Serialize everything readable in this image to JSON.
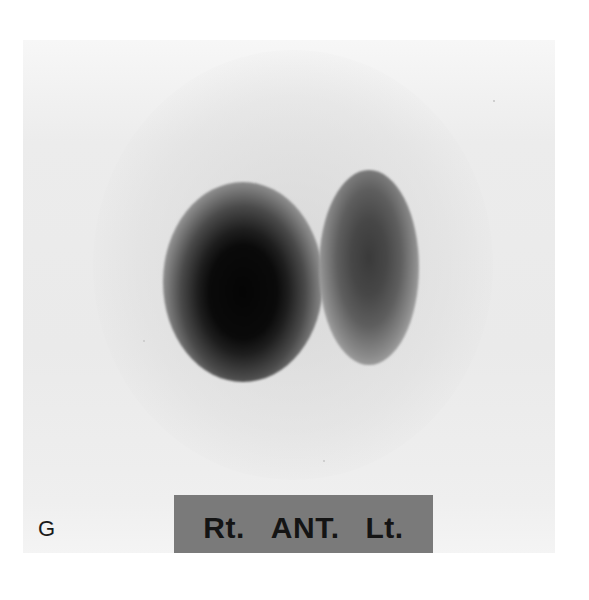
{
  "figure": {
    "panel_letter": "G",
    "view_label": {
      "right": "Rt.",
      "view": "ANT.",
      "left": "Lt."
    },
    "colors": {
      "background": "#ffffff",
      "panel": "#ececec",
      "label_bar": "#7a7a7a",
      "label_text": "#141414",
      "lobe_dense": "#050505",
      "lobe_light": "#3a3a3a"
    }
  }
}
